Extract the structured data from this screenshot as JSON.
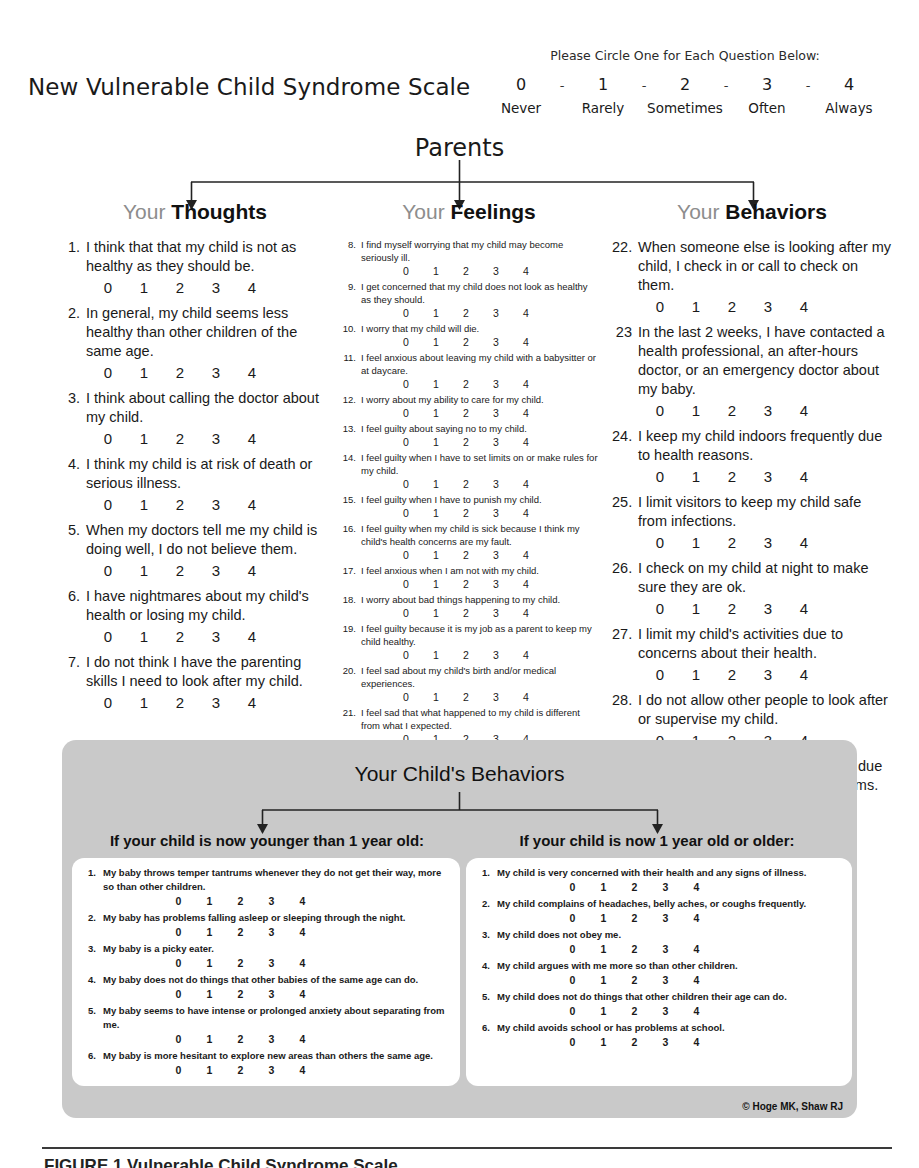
{
  "header": {
    "doc_title": "New Vulnerable Child Syndrome Scale",
    "legend_prompt": "Please Circle One for Each Question Below:",
    "legend_numbers": [
      "0",
      "1",
      "2",
      "3",
      "4"
    ],
    "legend_separator": "-",
    "legend_words": [
      "Never",
      "Rarely",
      "Sometimes",
      "Often",
      "Always"
    ]
  },
  "parents": {
    "title": "Parents",
    "columns": [
      {
        "head_prefix": "Your",
        "head_noun": "Thoughts",
        "items": [
          {
            "num": "1.",
            "text": "I think that that my child is not as healthy as they should be."
          },
          {
            "num": "2.",
            "text": "In general, my child seems less healthy than other children of the same age."
          },
          {
            "num": "3.",
            "text": "I think about calling the doctor about my child."
          },
          {
            "num": "4.",
            "text": "I think my child is at risk of death or serious illness."
          },
          {
            "num": "5.",
            "text": "When my doctors tell me my child is doing well, I do not believe them."
          },
          {
            "num": "6.",
            "text": "I have nightmares about my child's health or losing my child."
          },
          {
            "num": "7.",
            "text": "I do not think I have the parenting skills I need to look after my child."
          }
        ]
      },
      {
        "head_prefix": "Your",
        "head_noun": "Feelings",
        "items": [
          {
            "num": "8.",
            "text": "I find myself worrying that my child may become seriously ill."
          },
          {
            "num": "9.",
            "text": "I get concerned that my child does not look as healthy as they should."
          },
          {
            "num": "10.",
            "text": "I worry that my child will die."
          },
          {
            "num": "11.",
            "text": "I feel anxious about leaving my child with a babysitter or at daycare."
          },
          {
            "num": "12.",
            "text": "I worry about my ability to care for my child."
          },
          {
            "num": "13.",
            "text": "I feel guilty about saying no to my child."
          },
          {
            "num": "14.",
            "text": "I feel guilty when I have to set limits on or make rules for my child."
          },
          {
            "num": "15.",
            "text": "I feel guilty when I have to punish my child."
          },
          {
            "num": "16.",
            "text": "I feel guilty when my child is sick because I think my child's health concerns are my fault."
          },
          {
            "num": "17.",
            "text": "I feel anxious when I am not with my child."
          },
          {
            "num": "18.",
            "text": "I worry about bad things happening to my child."
          },
          {
            "num": "19.",
            "text": "I feel guilty because it is my job as a parent to keep my child healthy."
          },
          {
            "num": "20.",
            "text": "I feel sad about my child's birth and/or medical experiences."
          },
          {
            "num": "21.",
            "text": "I feel sad that what happened to my child is different from what I expected."
          }
        ]
      },
      {
        "head_prefix": "Your",
        "head_noun": "Behaviors",
        "items": [
          {
            "num": "22.",
            "text": "When someone else is looking after my child, I check in or call to check on them."
          },
          {
            "num": "23",
            "text": "In the last 2 weeks, I have contacted a health professional, an after-hours doctor, or an emergency doctor about my baby."
          },
          {
            "num": "24.",
            "text": "I keep my child indoors frequently due to health reasons."
          },
          {
            "num": "25.",
            "text": "I limit visitors to keep my child safe from infections."
          },
          {
            "num": "26.",
            "text": "I check on my child at night to make sure they are ok."
          },
          {
            "num": "27.",
            "text": "I limit my child's activities due to concerns about their health."
          },
          {
            "num": "28.",
            "text": "I do not allow other people to look after or supervise my child."
          },
          {
            "num": "29.",
            "text": "I keep my child home from school due to health or physical health problems."
          }
        ]
      }
    ]
  },
  "child_section": {
    "title": "Your Child's Behaviors",
    "left": {
      "subhead": "If your child is now younger than 1 year old:",
      "items": [
        {
          "num": "1.",
          "text": "My baby throws temper tantrums whenever they do not get their way, more so than other children."
        },
        {
          "num": "2.",
          "text": "My baby has problems falling asleep or sleeping through the night."
        },
        {
          "num": "3.",
          "text": "My baby is a picky eater."
        },
        {
          "num": "4.",
          "text": "My baby does not do things that other babies of the same age can do."
        },
        {
          "num": "5.",
          "text": "My baby seems to have intense or prolonged anxiety about separating from me."
        },
        {
          "num": "6.",
          "text": "My baby is more hesitant to explore new areas than others the same age."
        }
      ]
    },
    "right": {
      "subhead": "If your child is now 1 year old or older:",
      "items": [
        {
          "num": "1.",
          "text": "My child is very concerned with their health and any signs of illness."
        },
        {
          "num": "2.",
          "text": "My child complains of headaches, belly aches, or coughs frequently."
        },
        {
          "num": "3.",
          "text": "My child does not obey me."
        },
        {
          "num": "4.",
          "text": "My child argues with me more so than other children."
        },
        {
          "num": "5.",
          "text": "My child does not do things that other children their age can do."
        },
        {
          "num": "6.",
          "text": "My child avoids school or has problems at school."
        }
      ]
    },
    "copyright": "© Hoge MK, Shaw RJ"
  },
  "response_scale": [
    "0",
    "1",
    "2",
    "3",
    "4"
  ],
  "footer": {
    "caption": "FIGURE 1 Vulnerable Child Syndrome Scale"
  },
  "colors": {
    "panel_gray": "#c9c9c9",
    "heading_gray": "#8d8d8d",
    "text_black": "#1a1a1a"
  }
}
